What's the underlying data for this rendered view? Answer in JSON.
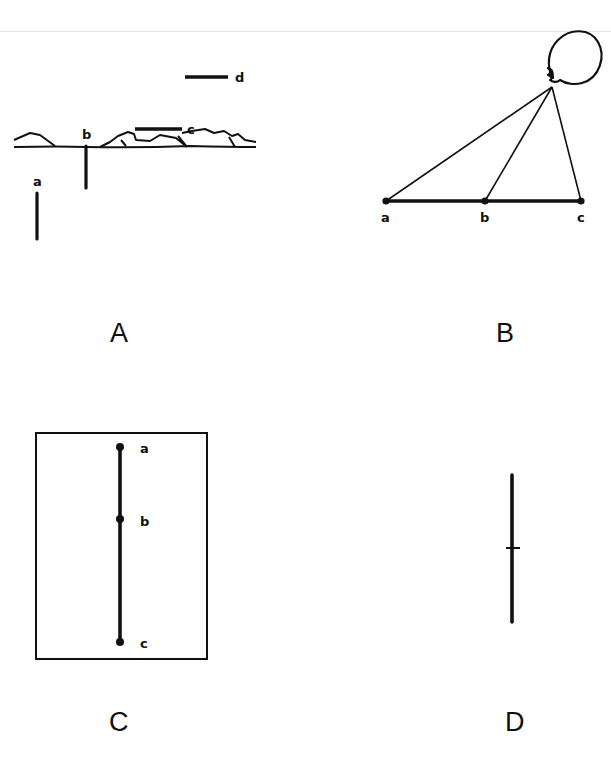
{
  "panels": [
    {
      "id": "A",
      "letter": "A",
      "points": {
        "a": "a",
        "b": "b",
        "c": "c",
        "d": "d"
      }
    },
    {
      "id": "B",
      "letter": "B",
      "points": {
        "a": "a",
        "b": "b",
        "c": "c"
      }
    },
    {
      "id": "C",
      "letter": "C",
      "points": {
        "a": "a",
        "b": "b",
        "c": "c"
      }
    },
    {
      "id": "D",
      "letter": "D"
    }
  ],
  "colors": {
    "ink": "#111111",
    "background": "#ffffff"
  }
}
